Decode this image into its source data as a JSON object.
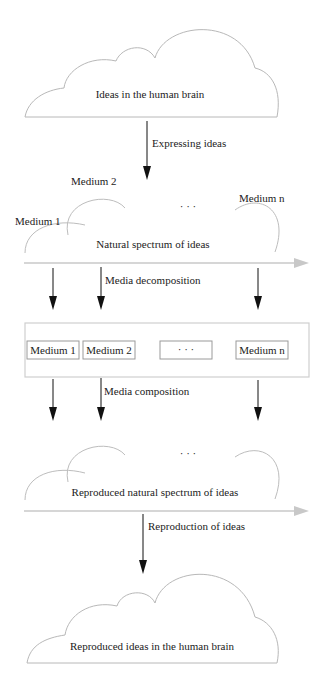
{
  "diagram": {
    "top_cloud": {
      "label": "Ideas in the human brain"
    },
    "arrow_expressing": {
      "label": "Expressing ideas"
    },
    "natural_spectrum": {
      "label": "Natural spectrum of ideas",
      "media_labels": [
        "Medium 1",
        "Medium 2",
        "Medium n"
      ],
      "ellipsis": "· · ·"
    },
    "arrow_decomposition": {
      "label": "Media decomposition"
    },
    "media_box": {
      "items": [
        "Medium 1",
        "Medium 2",
        "· · ·",
        "Medium n"
      ]
    },
    "arrow_composition": {
      "label": "Media composition"
    },
    "reproduced_spectrum": {
      "label": "Reproduced natural spectrum of ideas",
      "ellipsis": "· · ·"
    },
    "arrow_reproduction": {
      "label": "Reproduction of ideas"
    },
    "bottom_cloud": {
      "label": "Reproduced ideas in the human brain"
    },
    "colors": {
      "cloud_stroke": "#b8b8b8",
      "axis": "#c8c8c8",
      "arrow": "#111111",
      "text": "#222222"
    }
  }
}
